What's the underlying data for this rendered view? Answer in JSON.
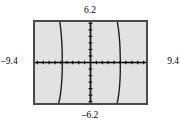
{
  "figure": {
    "name": "graphing-calculator-screen",
    "screen": {
      "background_color": "#e2e2e2",
      "border_color": "#4a4a4a",
      "curve_color": "#1a1a1a",
      "axis_color": "#000000"
    },
    "labels": {
      "x_min": "–9.4",
      "x_max": "9.4",
      "y_max": "6.2",
      "y_min": "–6.2"
    }
  },
  "chart_data": {
    "type": "line",
    "title": "",
    "xlabel": "",
    "ylabel": "",
    "xlim": [
      -9.4,
      9.4
    ],
    "ylim": [
      -6.2,
      6.2
    ],
    "grid": false,
    "legend": "none",
    "axis_ticks": {
      "x_tick_spacing": 1,
      "y_tick_spacing": 1,
      "x_tick_values": [
        -9,
        -8,
        -7,
        -6,
        -5,
        -4,
        -3,
        -2,
        -1,
        1,
        2,
        3,
        4,
        5,
        6,
        7,
        8,
        9
      ],
      "y_tick_values": [
        -6,
        -5,
        -4,
        -3,
        -2,
        -1,
        1,
        2,
        3,
        4,
        5,
        6
      ]
    },
    "annotations": [
      "x-axis end labels -9.4 and 9.4",
      "y-axis end labels 6.2 and -6.2"
    ],
    "series": [
      {
        "name": "branch-left",
        "points": [
          [
            -5.2,
            6.2
          ],
          [
            -5.05,
            5.2
          ],
          [
            -4.95,
            4.2
          ],
          [
            -4.87,
            3.2
          ],
          [
            -4.82,
            2.2
          ],
          [
            -4.79,
            1.2
          ],
          [
            -4.78,
            0.4
          ],
          [
            -4.78,
            0.0
          ],
          [
            -4.78,
            -0.6
          ],
          [
            -4.8,
            -1.6
          ],
          [
            -4.85,
            -2.6
          ],
          [
            -4.93,
            -3.6
          ],
          [
            -5.05,
            -4.6
          ],
          [
            -5.22,
            -5.6
          ],
          [
            -5.38,
            -6.2
          ]
        ]
      },
      {
        "name": "branch-center",
        "points": [
          [
            0.0,
            6.2
          ],
          [
            0.0,
            4.0
          ],
          [
            0.0,
            2.0
          ],
          [
            0.0,
            0.0
          ],
          [
            0.0,
            -2.0
          ],
          [
            0.0,
            -4.0
          ],
          [
            0.0,
            -6.2
          ]
        ]
      },
      {
        "name": "branch-right",
        "points": [
          [
            4.55,
            6.2
          ],
          [
            4.72,
            5.2
          ],
          [
            4.85,
            4.2
          ],
          [
            4.94,
            3.2
          ],
          [
            5.0,
            2.2
          ],
          [
            5.03,
            1.2
          ],
          [
            5.05,
            0.4
          ],
          [
            5.05,
            0.0
          ],
          [
            5.05,
            -0.6
          ],
          [
            5.04,
            -1.6
          ],
          [
            5.0,
            -2.6
          ],
          [
            4.93,
            -3.6
          ],
          [
            4.82,
            -4.6
          ],
          [
            4.66,
            -5.6
          ],
          [
            4.52,
            -6.2
          ]
        ]
      }
    ]
  }
}
